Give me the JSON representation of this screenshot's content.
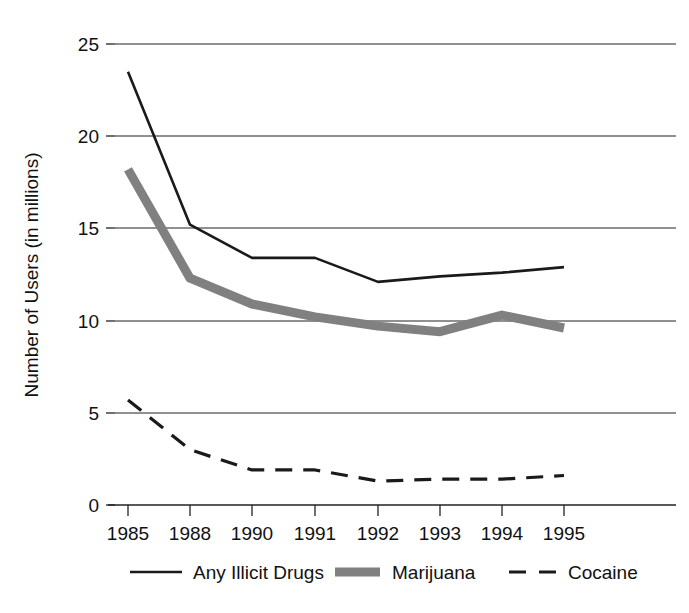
{
  "chart_data": {
    "type": "line",
    "title": "",
    "xlabel": "",
    "ylabel": "Number of Users (in millions)",
    "categories": [
      "1985",
      "1988",
      "1990",
      "1991",
      "1992",
      "1993",
      "1994",
      "1995"
    ],
    "x": [
      1985,
      1988,
      1990,
      1991,
      1992,
      1993,
      1994,
      1995
    ],
    "ylim": [
      0,
      25
    ],
    "xlim": [
      0,
      7
    ],
    "yticks": [
      0,
      5,
      10,
      15,
      20,
      25
    ],
    "ytick_labels": [
      "0",
      "5",
      "10",
      "15",
      "20",
      "25"
    ],
    "grid": "horizontal",
    "legend_position": "bottom",
    "series": [
      {
        "name": "Any Illicit Drugs",
        "style": "solid-thin",
        "color": "#1a1a1a",
        "values": [
          23.5,
          15.2,
          13.4,
          13.4,
          12.1,
          12.4,
          12.6,
          12.9
        ]
      },
      {
        "name": "Marijuana",
        "style": "solid-thick",
        "color": "#808080",
        "values": [
          18.2,
          12.3,
          10.9,
          10.2,
          9.7,
          9.4,
          10.3,
          9.6
        ]
      },
      {
        "name": "Cocaine",
        "style": "dashed",
        "color": "#1a1a1a",
        "values": [
          5.7,
          3.0,
          1.9,
          1.9,
          1.3,
          1.4,
          1.4,
          1.6
        ]
      }
    ]
  },
  "axis": {
    "y_title": "Number of Users (in millions)",
    "y_labels": [
      "25",
      "20",
      "15",
      "10",
      "5",
      "0"
    ],
    "x_labels": [
      "1985",
      "1988",
      "1990",
      "1991",
      "1992",
      "1993",
      "1994",
      "1995"
    ]
  },
  "legend": {
    "items": [
      {
        "label": "Any Illicit Drugs",
        "swatch": "solid-thin-line-swatch"
      },
      {
        "label": "Marijuana",
        "swatch": "thick-gray-line-swatch"
      },
      {
        "label": "Cocaine",
        "swatch": "dashed-line-swatch"
      }
    ]
  },
  "colors": {
    "ink": "#1a1a1a",
    "marijuana_gray": "#808080",
    "grid": "#222222",
    "background": "#ffffff"
  }
}
